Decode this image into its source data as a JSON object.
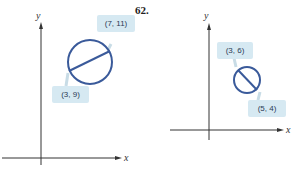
{
  "problem_number": "62.",
  "figures": [
    {
      "id": "left",
      "axis_labels": {
        "x": "x",
        "y": "y"
      },
      "endpoints": [
        {
          "label": "(7, 11)"
        },
        {
          "label": "(3, 9)"
        }
      ]
    },
    {
      "id": "right",
      "axis_labels": {
        "x": "x",
        "y": "y"
      },
      "endpoints": [
        {
          "label": "(3, 6)"
        },
        {
          "label": "(5, 4)"
        }
      ]
    }
  ],
  "colors": {
    "circle": "#3a5a9a",
    "callout_fill": "#d6e9f2",
    "axis": "#333333"
  }
}
